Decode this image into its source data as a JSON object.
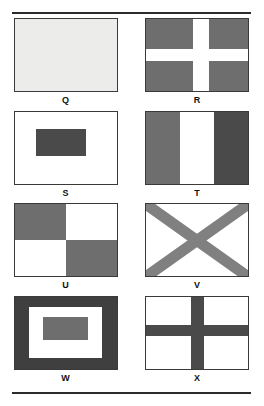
{
  "page": {
    "background": "#ffffff",
    "rule_color": "#2b2b2b"
  },
  "dividers": {
    "top_rule": "",
    "bottom_rule": ""
  },
  "palette": {
    "pale": "#ececeb",
    "light_gray": "#d9d9d9",
    "mid_gray": "#6e6e6e",
    "gray": "#646464",
    "dark_gray": "#4a4a4a",
    "charcoal": "#3f3f3f",
    "white": "#ffffff",
    "outline": "#3a3a3a",
    "label_color": "#111111"
  },
  "flags": [
    {
      "label": "Q",
      "name": "flag-q",
      "description": "plain pale field",
      "pattern": "solid",
      "colors": {
        "field": "#ececeb"
      }
    },
    {
      "label": "R",
      "name": "flag-r",
      "description": "white cross on gray field",
      "pattern": "cross",
      "colors": {
        "field": "#6e6e6e",
        "cross": "#ffffff"
      },
      "geometry": {
        "cross_width_pct": 16,
        "cross_height_pct": 16,
        "cross_x_pct": 46,
        "cross_y_pct": 42
      }
    },
    {
      "label": "S",
      "name": "flag-s",
      "description": "dark rectangle centered on white field",
      "pattern": "center-rect",
      "colors": {
        "field": "#ffffff",
        "rect": "#4a4a4a"
      },
      "geometry": {
        "rect_left_pct": 21,
        "rect_top_pct": 24,
        "rect_width_pct": 49,
        "rect_height_pct": 38
      }
    },
    {
      "label": "T",
      "name": "flag-t",
      "description": "three vertical bands: gray, white, dark gray",
      "pattern": "vertical-tribar",
      "colors": {
        "band_left": "#6e6e6e",
        "band_center": "#ffffff",
        "band_right": "#4a4a4a"
      }
    },
    {
      "label": "U",
      "name": "flag-u",
      "description": "quartered gray and white",
      "pattern": "quartered",
      "colors": {
        "top_left": "#6e6e6e",
        "top_right": "#ffffff",
        "bottom_left": "#ffffff",
        "bottom_right": "#6e6e6e"
      }
    },
    {
      "label": "V",
      "name": "flag-v",
      "description": "gray saltire on white field",
      "pattern": "saltire",
      "colors": {
        "field": "#ffffff",
        "saltire": "#808080"
      }
    },
    {
      "label": "W",
      "name": "flag-w",
      "description": "nested rectangles: dark border, white, gray center",
      "pattern": "nested-rects",
      "colors": {
        "outer": "#3f3f3f",
        "middle": "#ffffff",
        "inner": "#6e6e6e"
      },
      "geometry": {
        "mid_inset_pct": 14,
        "inner_left_pct": 28,
        "inner_top_pct": 28,
        "inner_width_pct": 44,
        "inner_height_pct": 33
      }
    },
    {
      "label": "X",
      "name": "flag-x",
      "description": "dark cross on white field",
      "pattern": "cross",
      "colors": {
        "field": "#ffffff",
        "cross": "#4a4a4a"
      },
      "geometry": {
        "cross_width_pct": 13,
        "cross_height_pct": 16,
        "cross_x_pct": 44,
        "cross_y_pct": 39
      }
    }
  ]
}
